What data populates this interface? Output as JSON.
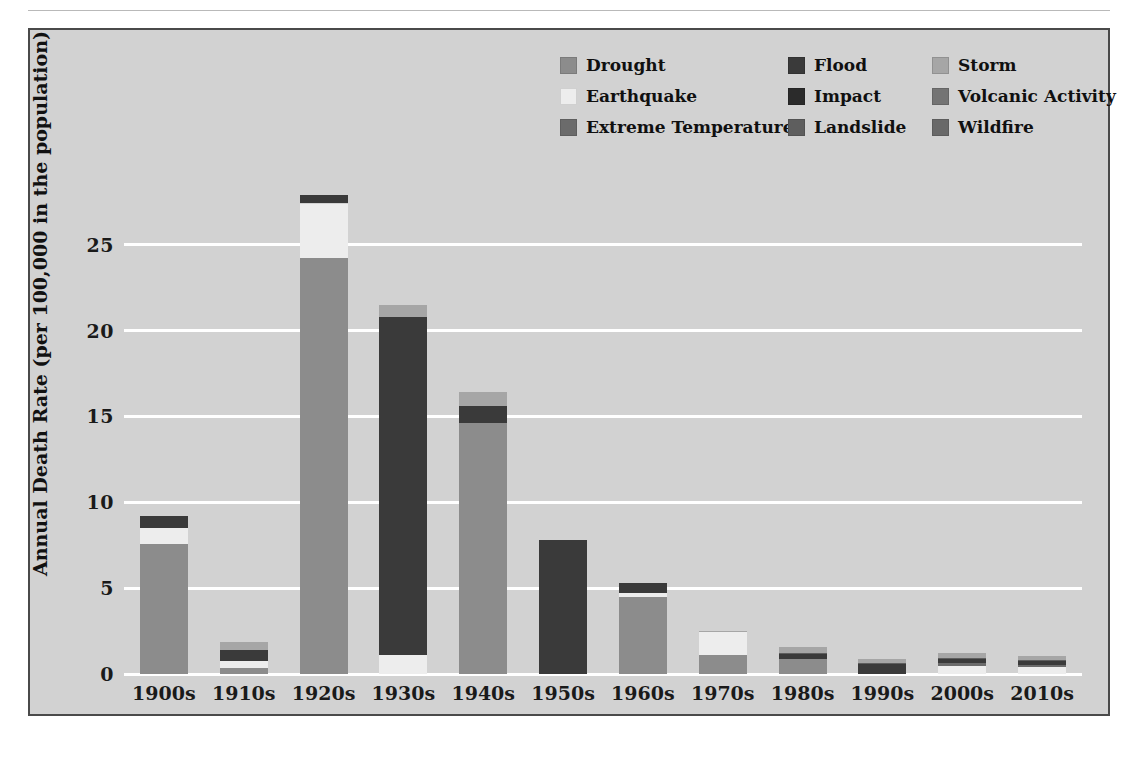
{
  "chart_data": {
    "type": "bar",
    "stacked": true,
    "title": "",
    "xlabel": "",
    "ylabel": "Annual Death Rate (per 100,000 in the population)",
    "ylim": [
      0,
      29
    ],
    "yticks": [
      0,
      5,
      10,
      15,
      20,
      25
    ],
    "ytick_labels": [
      "0",
      "5",
      "10",
      "15",
      "20",
      "25"
    ],
    "grid": true,
    "grid_axis": "y",
    "legend_position": "upper right",
    "legend_columns": 3,
    "categories": [
      "1900s",
      "1910s",
      "1920s",
      "1930s",
      "1940s",
      "1950s",
      "1960s",
      "1970s",
      "1980s",
      "1990s",
      "2000s",
      "2010s"
    ],
    "series": [
      {
        "name": "Drought",
        "color": "#8c8c8c",
        "values": [
          7.6,
          0.35,
          24.2,
          0.0,
          14.6,
          0.0,
          4.5,
          1.1,
          0.85,
          0.0,
          0.0,
          0.0
        ]
      },
      {
        "name": "Earthquake",
        "color": "#ededed",
        "values": [
          0.9,
          0.4,
          3.2,
          1.1,
          0.0,
          0.0,
          0.2,
          1.35,
          0.0,
          0.0,
          0.45,
          0.4
        ]
      },
      {
        "name": "Extreme Temperature",
        "color": "#6b6b6b",
        "values": [
          0.0,
          0.0,
          0.0,
          0.0,
          0.0,
          0.0,
          0.0,
          0.0,
          0.0,
          0.0,
          0.2,
          0.15
        ]
      },
      {
        "name": "Flood",
        "color": "#3a3a3a",
        "values": [
          0.7,
          0.65,
          0.5,
          19.7,
          1.0,
          7.8,
          0.6,
          0.0,
          0.3,
          0.6,
          0.25,
          0.2
        ]
      },
      {
        "name": "Impact",
        "color": "#2b2b2b",
        "values": [
          0.0,
          0.0,
          0.0,
          0.0,
          0.0,
          0.0,
          0.0,
          0.0,
          0.0,
          0.0,
          0.0,
          0.0
        ]
      },
      {
        "name": "Landslide",
        "color": "#5e5e5e",
        "values": [
          0.0,
          0.0,
          0.0,
          0.0,
          0.0,
          0.0,
          0.0,
          0.0,
          0.05,
          0.05,
          0.05,
          0.05
        ]
      },
      {
        "name": "Storm",
        "color": "#a6a6a6",
        "values": [
          0.0,
          0.45,
          0.0,
          0.7,
          0.8,
          0.0,
          0.0,
          0.05,
          0.35,
          0.2,
          0.3,
          0.25
        ]
      },
      {
        "name": "Volcanic Activity",
        "color": "#747474",
        "values": [
          0.0,
          0.0,
          0.0,
          0.0,
          0.0,
          0.0,
          0.0,
          0.0,
          0.0,
          0.0,
          0.0,
          0.0
        ]
      },
      {
        "name": "Wildfire",
        "color": "#696969",
        "values": [
          0.0,
          0.0,
          0.0,
          0.0,
          0.0,
          0.0,
          0.0,
          0.0,
          0.0,
          0.0,
          0.0,
          0.0
        ]
      }
    ],
    "totals": [
      9.2,
      1.85,
      27.9,
      21.5,
      16.4,
      7.8,
      5.3,
      2.5,
      1.55,
      0.85,
      1.25,
      1.05
    ],
    "background_color": "#d2d2d2",
    "gridline_color": "#ffffff",
    "frame_color": "#4a4a4a"
  },
  "legend": {
    "entries": [
      {
        "label": "Drought",
        "color": "#8c8c8c",
        "col": 0,
        "row": 0
      },
      {
        "label": "Earthquake",
        "color": "#ededed",
        "col": 0,
        "row": 1
      },
      {
        "label": "Extreme Temperature",
        "color": "#6b6b6b",
        "col": 0,
        "row": 2
      },
      {
        "label": "Flood",
        "color": "#3a3a3a",
        "col": 1,
        "row": 0
      },
      {
        "label": "Impact",
        "color": "#2b2b2b",
        "col": 1,
        "row": 1
      },
      {
        "label": "Landslide",
        "color": "#5e5e5e",
        "col": 1,
        "row": 2
      },
      {
        "label": "Storm",
        "color": "#a6a6a6",
        "col": 2,
        "row": 0
      },
      {
        "label": "Volcanic Activity",
        "color": "#747474",
        "col": 2,
        "row": 1
      },
      {
        "label": "Wildfire",
        "color": "#696969",
        "col": 2,
        "row": 2
      }
    ]
  }
}
